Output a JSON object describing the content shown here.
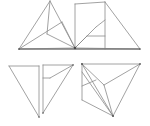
{
  "canvas": {
    "width": 150,
    "height": 126,
    "background": "#ffffff",
    "title": "Triangle dissection line figure"
  },
  "style": {
    "stroke_color": "#8a8a8a",
    "stroke_color_dark": "#6e6e6e",
    "baseline_color": "#7a7a7a",
    "vertex_color": "#4a4a4a",
    "stroke_width": 0.8,
    "baseline_width": 1.5
  },
  "figures": [
    {
      "id": "top-composite",
      "label": "Top composite triangle pair",
      "description": "Two large triangles sharing a common horizontal baseline and a central hub vertex, each subdivided by internal segments",
      "baseline": {
        "x1": 19,
        "y1": 49,
        "x2": 140,
        "y2": 49
      },
      "vertices": [
        {
          "name": "left-base",
          "x": 19,
          "y": 49
        },
        {
          "name": "hub",
          "x": 75,
          "y": 48
        },
        {
          "name": "right-base",
          "x": 140,
          "y": 49
        },
        {
          "name": "left-apex",
          "x": 50,
          "y": 1
        },
        {
          "name": "right-apex",
          "x": 105,
          "y": 2
        },
        {
          "name": "upper-mid-left",
          "x": 62,
          "y": 22
        },
        {
          "name": "mid-left-node",
          "x": 47,
          "y": 34
        },
        {
          "name": "right-inner-node",
          "x": 96,
          "y": 27
        },
        {
          "name": "right-low-node",
          "x": 87,
          "y": 36
        },
        {
          "name": "vertical-foot",
          "x": 105,
          "y": 49
        }
      ],
      "segments": [
        {
          "name": "left-outer-left",
          "x1": 19,
          "y1": 49,
          "x2": 50,
          "y2": 1
        },
        {
          "name": "left-outer-right",
          "x1": 50,
          "y1": 1,
          "x2": 75,
          "y2": 48
        },
        {
          "name": "left-base-edge",
          "x1": 19,
          "y1": 49,
          "x2": 75,
          "y2": 48
        },
        {
          "name": "left-apex-to-midleft",
          "x1": 50,
          "y1": 1,
          "x2": 47,
          "y2": 34
        },
        {
          "name": "leftbase-to-uppermid",
          "x1": 19,
          "y1": 49,
          "x2": 62,
          "y2": 22
        },
        {
          "name": "midleft-to-hub",
          "x1": 47,
          "y1": 34,
          "x2": 75,
          "y2": 48
        },
        {
          "name": "uppermid-to-hub",
          "x1": 62,
          "y1": 22,
          "x2": 75,
          "y2": 48
        },
        {
          "name": "hub-vertical",
          "x1": 75,
          "y1": 48,
          "x2": 75,
          "y2": 4
        },
        {
          "name": "right-outer-left",
          "x1": 75,
          "y1": 4,
          "x2": 105,
          "y2": 2
        },
        {
          "name": "right-apex-to-rightbase",
          "x1": 105,
          "y1": 2,
          "x2": 140,
          "y2": 49
        },
        {
          "name": "right-base-edge",
          "x1": 75,
          "y1": 48,
          "x2": 140,
          "y2": 49
        },
        {
          "name": "rightapex-vertical",
          "x1": 105,
          "y1": 2,
          "x2": 105,
          "y2": 49
        },
        {
          "name": "hub-to-rightinner",
          "x1": 75,
          "y1": 48,
          "x2": 96,
          "y2": 27
        },
        {
          "name": "hub-to-rightlow",
          "x1": 75,
          "y1": 48,
          "x2": 87,
          "y2": 36
        },
        {
          "name": "rightlow-to-rightapexline",
          "x1": 87,
          "y1": 36,
          "x2": 105,
          "y2": 36
        },
        {
          "name": "rightinner-to-apexline",
          "x1": 96,
          "y1": 27,
          "x2": 105,
          "y2": 20
        }
      ]
    },
    {
      "id": "bottom-left",
      "label": "Bottom-left right triangle",
      "description": "A right triangle with vertical right leg and horizontal top edge",
      "vertices": [
        {
          "name": "top-left",
          "x": 9,
          "y": 66
        },
        {
          "name": "top-right",
          "x": 39,
          "y": 66
        },
        {
          "name": "bottom-right",
          "x": 39,
          "y": 117
        }
      ],
      "segments": [
        {
          "name": "top-edge",
          "x1": 9,
          "y1": 66,
          "x2": 39,
          "y2": 66
        },
        {
          "name": "right-leg",
          "x1": 39,
          "y1": 66,
          "x2": 39,
          "y2": 117
        },
        {
          "name": "hypotenuse",
          "x1": 9,
          "y1": 66,
          "x2": 39,
          "y2": 117
        }
      ]
    },
    {
      "id": "bottom-middle",
      "label": "Bottom-middle dissected triangle",
      "description": "A narrow triangle with vertical left edge and internal fan segments",
      "vertices": [
        {
          "name": "top-left",
          "x": 43,
          "y": 65
        },
        {
          "name": "top-right",
          "x": 73,
          "y": 65
        },
        {
          "name": "bottom-left",
          "x": 43,
          "y": 113
        },
        {
          "name": "inner-node",
          "x": 50,
          "y": 78
        }
      ],
      "segments": [
        {
          "name": "top-edge",
          "x1": 43,
          "y1": 65,
          "x2": 73,
          "y2": 65
        },
        {
          "name": "left-leg",
          "x1": 43,
          "y1": 65,
          "x2": 43,
          "y2": 113
        },
        {
          "name": "hypotenuse",
          "x1": 73,
          "y1": 65,
          "x2": 43,
          "y2": 113
        },
        {
          "name": "topright-to-inner",
          "x1": 73,
          "y1": 65,
          "x2": 50,
          "y2": 78
        },
        {
          "name": "inner-to-left",
          "x1": 50,
          "y1": 78,
          "x2": 43,
          "y2": 78
        }
      ]
    },
    {
      "id": "bottom-right",
      "label": "Bottom-right dissected triangle",
      "description": "A large triangle with apex at lower right, subdivided by a fan of internal segments from the top-left corner",
      "vertices": [
        {
          "name": "top-left",
          "x": 82,
          "y": 64
        },
        {
          "name": "top-right",
          "x": 140,
          "y": 64
        },
        {
          "name": "bottom-apex",
          "x": 113,
          "y": 116
        },
        {
          "name": "left-low",
          "x": 82,
          "y": 100
        },
        {
          "name": "inner-node-a",
          "x": 104,
          "y": 85
        },
        {
          "name": "inner-node-b",
          "x": 96,
          "y": 80
        }
      ],
      "segments": [
        {
          "name": "top-edge",
          "x1": 82,
          "y1": 64,
          "x2": 140,
          "y2": 64
        },
        {
          "name": "right-edge",
          "x1": 140,
          "y1": 64,
          "x2": 113,
          "y2": 116
        },
        {
          "name": "left-edge",
          "x1": 82,
          "y1": 64,
          "x2": 113,
          "y2": 116
        },
        {
          "name": "left-vertical",
          "x1": 82,
          "y1": 64,
          "x2": 82,
          "y2": 100
        },
        {
          "name": "bottom-left-edge",
          "x1": 82,
          "y1": 100,
          "x2": 113,
          "y2": 116
        },
        {
          "name": "topleft-to-innerA",
          "x1": 82,
          "y1": 64,
          "x2": 104,
          "y2": 85
        },
        {
          "name": "innerA-to-topright",
          "x1": 104,
          "y1": 85,
          "x2": 140,
          "y2": 64
        },
        {
          "name": "innerA-to-apex",
          "x1": 104,
          "y1": 85,
          "x2": 113,
          "y2": 116
        },
        {
          "name": "innerB-to-leftlow",
          "x1": 96,
          "y1": 80,
          "x2": 82,
          "y2": 86
        },
        {
          "name": "topleft-to-apex-chord",
          "x1": 82,
          "y1": 72,
          "x2": 113,
          "y2": 116
        }
      ]
    }
  ],
  "baselines": [
    {
      "name": "top-baseline",
      "x1": 19,
      "y1": 49,
      "x2": 140,
      "y2": 49
    },
    {
      "name": "bottom-left-foot",
      "x1": 82,
      "y1": 100,
      "x2": 82,
      "y2": 100
    }
  ],
  "vertex_markers": [
    {
      "name": "hub-marker",
      "x": 75,
      "y": 48,
      "size": 2.2
    },
    {
      "name": "left-base-marker",
      "x": 19,
      "y": 49,
      "size": 1.4
    },
    {
      "name": "right-base-marker",
      "x": 140,
      "y": 49,
      "size": 1.2
    },
    {
      "name": "bottom-right-topleft-marker",
      "x": 82,
      "y": 64,
      "size": 1.6
    },
    {
      "name": "bottom-right-topright-marker",
      "x": 140,
      "y": 64,
      "size": 1.4
    },
    {
      "name": "bottom-right-apex-marker",
      "x": 113,
      "y": 116,
      "size": 1.6
    },
    {
      "name": "bottom-middle-topright-marker",
      "x": 73,
      "y": 65,
      "size": 1.2
    },
    {
      "name": "bottom-middle-bottom-marker",
      "x": 43,
      "y": 113,
      "size": 1.2
    },
    {
      "name": "bottom-left-bottom-marker",
      "x": 39,
      "y": 117,
      "size": 1.2
    }
  ]
}
